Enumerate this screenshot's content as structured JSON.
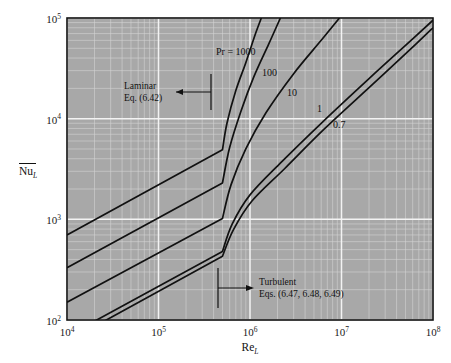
{
  "chart_data": {
    "type": "line",
    "title": "",
    "xlabel": "Re_L",
    "ylabel": "Nu_L",
    "xscale": "log",
    "yscale": "log",
    "xlim": [
      10000,
      100000000
    ],
    "ylim": [
      100,
      100000
    ],
    "grid": true,
    "legend_position": "inline-curve-labels",
    "x_tick_labels": [
      "10⁴",
      "10⁵",
      "10⁶",
      "10⁷",
      "10⁸"
    ],
    "y_tick_labels": [
      "10²",
      "10³",
      "10⁴",
      "10⁵"
    ],
    "x_ticks": [
      10000,
      100000,
      1000000,
      10000000,
      100000000
    ],
    "y_ticks": [
      100,
      1000,
      10000,
      100000
    ],
    "transition_re": 500000,
    "series": [
      {
        "name": "Pr = 1000",
        "label": "1000",
        "laminar": [
          [
            10000,
            700
          ],
          [
            500000,
            4900
          ]
        ],
        "turbulent": [
          [
            500000,
            4900
          ],
          [
            560000,
            9000
          ],
          [
            700000,
            19000
          ],
          [
            900000,
            36000
          ],
          [
            1150000,
            70000
          ],
          [
            1330000,
            100000
          ]
        ]
      },
      {
        "name": "Pr = 100",
        "label": "100",
        "laminar": [
          [
            10000,
            330
          ],
          [
            500000,
            2300
          ]
        ],
        "turbulent": [
          [
            500000,
            2300
          ],
          [
            600000,
            5200
          ],
          [
            800000,
            12000
          ],
          [
            1100000,
            26000
          ],
          [
            1600000,
            55000
          ],
          [
            2150000,
            100000
          ]
        ]
      },
      {
        "name": "Pr = 10",
        "label": "10",
        "laminar": [
          [
            10000,
            150
          ],
          [
            500000,
            1020
          ]
        ],
        "turbulent": [
          [
            500000,
            1020
          ],
          [
            620000,
            2200
          ],
          [
            900000,
            5000
          ],
          [
            1500000,
            11500
          ],
          [
            3000000,
            28000
          ],
          [
            6000000,
            60000
          ],
          [
            9500000,
            100000
          ]
        ]
      },
      {
        "name": "Pr = 1",
        "label": "1",
        "laminar": [
          [
            10000,
            69
          ],
          [
            500000,
            480
          ]
        ],
        "turbulent": [
          [
            500000,
            480
          ],
          [
            640000,
            900
          ],
          [
            1000000,
            1750
          ],
          [
            2200000,
            3700
          ],
          [
            6000000,
            9000
          ],
          [
            20000000,
            25000
          ],
          [
            60000000,
            62000
          ],
          [
            100000000,
            95000
          ]
        ]
      },
      {
        "name": "Pr = 0.7",
        "label": "0.7",
        "laminar": [
          [
            10000,
            61
          ],
          [
            500000,
            430
          ]
        ],
        "turbulent": [
          [
            500000,
            430
          ],
          [
            660000,
            790
          ],
          [
            1050000,
            1520
          ],
          [
            2400000,
            3200
          ],
          [
            6500000,
            7900
          ],
          [
            22000000,
            22000
          ],
          [
            65000000,
            55000
          ],
          [
            100000000,
            80000
          ]
        ]
      }
    ],
    "curve_labels": [
      {
        "id": "pr-1000",
        "text": "Pr = 1000"
      },
      {
        "id": "pr-100",
        "text": "100"
      },
      {
        "id": "pr-10",
        "text": "10"
      },
      {
        "id": "pr-1",
        "text": "1"
      },
      {
        "id": "pr-07",
        "text": "0.7"
      }
    ],
    "annotations": [
      {
        "id": "laminar",
        "line1": "Laminar",
        "line2": "Eq. (6.42)",
        "arrow_direction": "left"
      },
      {
        "id": "turbulent",
        "line1": "Turbulent",
        "line2": "Eqs. (6.47, 6.48, 6.49)",
        "arrow_direction": "right"
      }
    ]
  },
  "axes": {
    "x_title_base": "Re",
    "x_title_sub": "L",
    "y_title_base": "Nu",
    "y_title_sub": "L",
    "y_title_overbar": true,
    "x_ticks": [
      {
        "mantissa": "10",
        "exp": "4"
      },
      {
        "mantissa": "10",
        "exp": "5"
      },
      {
        "mantissa": "10",
        "exp": "6"
      },
      {
        "mantissa": "10",
        "exp": "7"
      },
      {
        "mantissa": "10",
        "exp": "8"
      }
    ],
    "y_ticks": [
      {
        "mantissa": "10",
        "exp": "5"
      },
      {
        "mantissa": "10",
        "exp": "4"
      },
      {
        "mantissa": "10",
        "exp": "3"
      },
      {
        "mantissa": "10",
        "exp": "2"
      }
    ]
  },
  "colors": {
    "plot_background": "#a8a8a8",
    "grid_major": "#f3f3f3",
    "grid_minor": "#d4d4d4",
    "curve": "#111111",
    "frame": "#111111",
    "text": "#111111",
    "page_background": "#ffffff"
  }
}
